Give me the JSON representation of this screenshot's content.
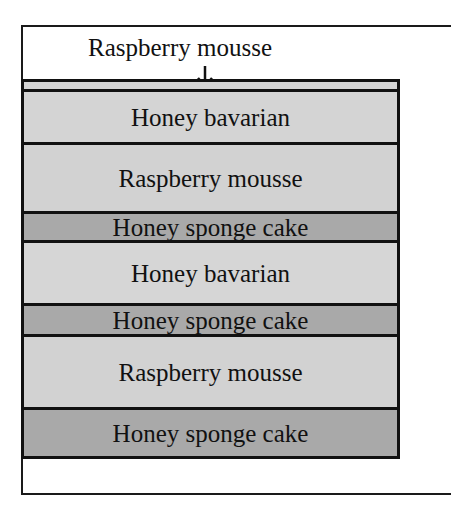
{
  "diagram": {
    "top_label": "Raspberry mousse",
    "colors": {
      "light": "#d4d4d4",
      "dark": "#a9a9a9",
      "border": "#111111",
      "background": "#ffffff"
    },
    "layers": [
      {
        "label": "",
        "shade": "light",
        "height": 10
      },
      {
        "label": "Honey bavarian",
        "shade": "light",
        "height": 53
      },
      {
        "label": "Raspberry mousse",
        "shade": "light",
        "height": 69
      },
      {
        "label": "Honey sponge cake",
        "shade": "dark",
        "height": 29
      },
      {
        "label": "Honey bavarian",
        "shade": "light",
        "height": 63
      },
      {
        "label": "Honey sponge cake",
        "shade": "dark",
        "height": 31
      },
      {
        "label": "Raspberry mousse",
        "shade": "light",
        "height": 73
      },
      {
        "label": "Honey sponge cake",
        "shade": "dark",
        "height": 52
      }
    ]
  }
}
